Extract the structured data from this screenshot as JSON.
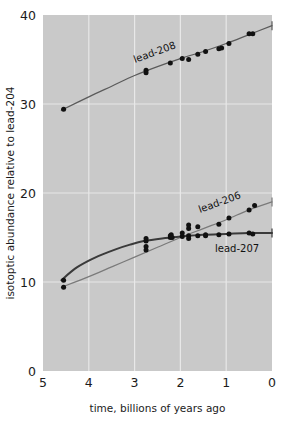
{
  "chart_data": {
    "type": "scatter",
    "title": "",
    "xlabel": "time, billions of years ago",
    "ylabel": "isotoptic abundance relative to lead-204",
    "xlim": [
      5,
      0
    ],
    "ylim": [
      0,
      40
    ],
    "x_reversed": true,
    "xticks": [
      "5",
      "4",
      "3",
      "2",
      "1",
      "0"
    ],
    "yticks": [
      "0",
      "10",
      "20",
      "30",
      "40"
    ],
    "grid": true,
    "legend_position": "inline-annotations",
    "series": [
      {
        "name": "lead-208",
        "label": "lead-208",
        "label_rotation": -20,
        "color": "#5a5a5a",
        "points": [
          {
            "x": 4.55,
            "y": 29.4
          },
          {
            "x": 2.75,
            "y": 33.8
          },
          {
            "x": 2.75,
            "y": 33.5
          },
          {
            "x": 2.22,
            "y": 34.6
          },
          {
            "x": 1.96,
            "y": 35.1
          },
          {
            "x": 1.82,
            "y": 35.0
          },
          {
            "x": 1.62,
            "y": 35.6
          },
          {
            "x": 1.45,
            "y": 35.9
          },
          {
            "x": 1.16,
            "y": 36.2
          },
          {
            "x": 1.1,
            "y": 36.3
          },
          {
            "x": 0.94,
            "y": 36.8
          },
          {
            "x": 0.5,
            "y": 37.9
          },
          {
            "x": 0.42,
            "y": 37.9
          }
        ],
        "fit": [
          {
            "x": 4.6,
            "y": 29.3
          },
          {
            "x": 4.0,
            "y": 30.8
          },
          {
            "x": 3.5,
            "y": 32.0
          },
          {
            "x": 3.0,
            "y": 33.2
          },
          {
            "x": 2.5,
            "y": 34.2
          },
          {
            "x": 2.0,
            "y": 35.1
          },
          {
            "x": 1.5,
            "y": 35.9
          },
          {
            "x": 1.0,
            "y": 36.8
          },
          {
            "x": 0.5,
            "y": 37.8
          },
          {
            "x": 0.0,
            "y": 38.8
          }
        ]
      },
      {
        "name": "lead-206",
        "label": "lead-206",
        "label_rotation": -20,
        "color": "#7a7a7a",
        "points": [
          {
            "x": 4.55,
            "y": 9.4
          },
          {
            "x": 2.75,
            "y": 13.6
          },
          {
            "x": 2.75,
            "y": 14.0
          },
          {
            "x": 2.22,
            "y": 15.0
          },
          {
            "x": 2.2,
            "y": 15.3
          },
          {
            "x": 1.96,
            "y": 15.5
          },
          {
            "x": 1.82,
            "y": 16.0
          },
          {
            "x": 1.82,
            "y": 16.4
          },
          {
            "x": 1.62,
            "y": 16.2
          },
          {
            "x": 1.45,
            "y": 15.3
          },
          {
            "x": 1.16,
            "y": 16.5
          },
          {
            "x": 0.94,
            "y": 17.2
          },
          {
            "x": 0.5,
            "y": 18.1
          },
          {
            "x": 0.38,
            "y": 18.6
          }
        ],
        "fit": [
          {
            "x": 4.6,
            "y": 9.4
          },
          {
            "x": 4.0,
            "y": 10.6
          },
          {
            "x": 3.5,
            "y": 11.7
          },
          {
            "x": 3.0,
            "y": 12.8
          },
          {
            "x": 2.5,
            "y": 13.9
          },
          {
            "x": 2.0,
            "y": 15.0
          },
          {
            "x": 1.5,
            "y": 16.0
          },
          {
            "x": 1.0,
            "y": 17.0
          },
          {
            "x": 0.5,
            "y": 18.1
          },
          {
            "x": 0.0,
            "y": 19.0
          }
        ]
      },
      {
        "name": "lead-207",
        "label": "lead-207",
        "label_rotation": 0,
        "color": "#3a3a3a",
        "points": [
          {
            "x": 4.55,
            "y": 10.2
          },
          {
            "x": 2.75,
            "y": 14.6
          },
          {
            "x": 2.75,
            "y": 14.9
          },
          {
            "x": 2.22,
            "y": 15.2
          },
          {
            "x": 2.18,
            "y": 15.0
          },
          {
            "x": 1.96,
            "y": 15.1
          },
          {
            "x": 1.82,
            "y": 15.2
          },
          {
            "x": 1.82,
            "y": 14.9
          },
          {
            "x": 1.62,
            "y": 15.2
          },
          {
            "x": 1.45,
            "y": 15.2
          },
          {
            "x": 1.16,
            "y": 15.3
          },
          {
            "x": 0.94,
            "y": 15.4
          },
          {
            "x": 0.5,
            "y": 15.5
          },
          {
            "x": 0.42,
            "y": 15.4
          }
        ],
        "fit": [
          {
            "x": 4.6,
            "y": 10.2
          },
          {
            "x": 4.3,
            "y": 11.5
          },
          {
            "x": 4.0,
            "y": 12.4
          },
          {
            "x": 3.7,
            "y": 13.1
          },
          {
            "x": 3.4,
            "y": 13.7
          },
          {
            "x": 3.1,
            "y": 14.2
          },
          {
            "x": 2.8,
            "y": 14.6
          },
          {
            "x": 2.4,
            "y": 14.9
          },
          {
            "x": 2.0,
            "y": 15.1
          },
          {
            "x": 1.5,
            "y": 15.3
          },
          {
            "x": 1.0,
            "y": 15.4
          },
          {
            "x": 0.5,
            "y": 15.5
          },
          {
            "x": 0.0,
            "y": 15.5
          }
        ]
      }
    ]
  },
  "colors": {
    "plot_background": "#c9c9c9",
    "page_background": "#ffffff",
    "gridline": "#e8e8e8",
    "marker": "#111111",
    "text": "#1b1b1b"
  }
}
